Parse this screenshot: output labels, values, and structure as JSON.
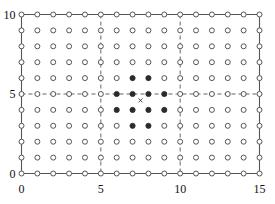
{
  "chart_data": {
    "type": "scatter",
    "title": "",
    "xlabel": "",
    "ylabel": "",
    "xlim": [
      0,
      15
    ],
    "ylim": [
      0,
      10
    ],
    "grid": false,
    "legend": null,
    "xticks": [
      0,
      5,
      10,
      15
    ],
    "xticklabels": [
      "0",
      "5",
      "10",
      "15"
    ],
    "yticks": [
      0,
      5,
      10
    ],
    "yticklabels": [
      "0",
      "5",
      "10"
    ],
    "lattice": {
      "x_values": [
        0,
        1,
        2,
        3,
        4,
        5,
        6,
        7,
        8,
        9,
        10,
        11,
        12,
        13,
        14,
        15
      ],
      "y_values": [
        0,
        1,
        2,
        3,
        4,
        5,
        6,
        7,
        8,
        9,
        10
      ],
      "marker": "open-circle",
      "marker_edge_color": "#555555",
      "marker_face_color": "#ffffff",
      "count": 176
    },
    "filled_points": {
      "marker": "filled-circle",
      "color": "#2b2b2b",
      "points": [
        [
          7,
          6
        ],
        [
          8,
          6
        ],
        [
          6,
          5
        ],
        [
          7,
          5
        ],
        [
          8,
          5
        ],
        [
          9,
          5
        ],
        [
          6,
          4
        ],
        [
          7,
          4
        ],
        [
          8,
          4
        ],
        [
          9,
          4
        ],
        [
          7,
          3
        ],
        [
          8,
          3
        ]
      ],
      "count": 12
    },
    "crosshair_points": {
      "marker": "circle-with-cross",
      "color": "#333333",
      "points": [
        [
          5,
          10
        ],
        [
          5,
          9
        ],
        [
          5,
          8
        ],
        [
          5,
          7
        ],
        [
          5,
          6
        ],
        [
          5,
          5
        ],
        [
          5,
          4
        ],
        [
          5,
          3
        ],
        [
          5,
          2
        ],
        [
          5,
          1
        ],
        [
          5,
          0
        ],
        [
          10,
          10
        ],
        [
          10,
          9
        ],
        [
          10,
          8
        ],
        [
          10,
          7
        ],
        [
          10,
          6
        ],
        [
          10,
          5
        ],
        [
          10,
          4
        ],
        [
          10,
          3
        ],
        [
          10,
          2
        ],
        [
          10,
          1
        ],
        [
          10,
          0
        ],
        [
          0,
          5
        ],
        [
          1,
          5
        ],
        [
          2,
          5
        ],
        [
          3,
          5
        ],
        [
          4,
          5
        ],
        [
          11,
          5
        ],
        [
          12,
          5
        ],
        [
          13,
          5
        ],
        [
          14,
          5
        ],
        [
          15,
          5
        ]
      ]
    },
    "reference_lines": [
      {
        "orientation": "vertical",
        "value": 5,
        "style": "dashed",
        "color": "#555555"
      },
      {
        "orientation": "vertical",
        "value": 10,
        "style": "dashed",
        "color": "#555555"
      },
      {
        "orientation": "horizontal",
        "value": 5,
        "style": "dashed",
        "color": "#555555"
      }
    ],
    "x_marker": {
      "marker": "x",
      "color": "#333333",
      "point": [
        7.5,
        4.6
      ]
    },
    "frame": {
      "style": "solid",
      "color": "#555555",
      "sides": [
        "left",
        "right",
        "top",
        "bottom"
      ]
    }
  },
  "colors": {
    "background": "#ffffff",
    "frame": "#555555",
    "open_marker_edge": "#555555",
    "filled_marker": "#2b2b2b",
    "dashed_line": "#555555",
    "tick_label": "#111111"
  }
}
